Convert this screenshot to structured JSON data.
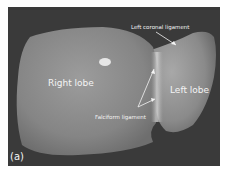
{
  "figure": {
    "panel_label": "(a)",
    "labels": {
      "right_lobe": "Right lobe",
      "left_lobe": "Left lobe",
      "left_coronal_ligament": "Left coronal ligament",
      "falciform_ligament": "Falciform ligament"
    },
    "colors": {
      "background": "#3a3a3a",
      "organ": "#8a8a8a",
      "text": "#f4f4f4"
    }
  }
}
